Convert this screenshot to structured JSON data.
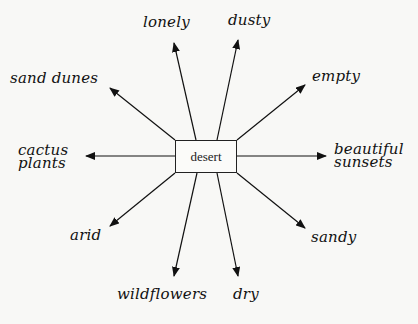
{
  "diagram": {
    "type": "word web / semantic map",
    "center": {
      "label": "desert"
    },
    "branches": [
      {
        "id": "lonely",
        "label": "lonely"
      },
      {
        "id": "dusty",
        "label": "dusty"
      },
      {
        "id": "sand-dunes",
        "label": "sand dunes"
      },
      {
        "id": "empty",
        "label": "empty"
      },
      {
        "id": "cactus-plants",
        "label": "cactus plants",
        "lines": [
          "cactus",
          "plants"
        ]
      },
      {
        "id": "beautiful-sunsets",
        "label": "beautiful sunsets",
        "lines": [
          "beautiful",
          "sunsets"
        ]
      },
      {
        "id": "arid",
        "label": "arid"
      },
      {
        "id": "sandy",
        "label": "sandy"
      },
      {
        "id": "wildflowers",
        "label": "wildflowers"
      },
      {
        "id": "dry",
        "label": "dry"
      }
    ],
    "colors": {
      "ink": "#111111",
      "background": "#f8f8f6"
    }
  }
}
